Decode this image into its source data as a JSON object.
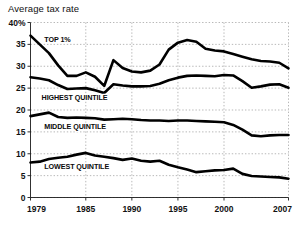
{
  "chart_data": {
    "type": "line",
    "title": "Average tax rate",
    "xlabel": "",
    "ylabel": "",
    "xlim": [
      1979,
      2007
    ],
    "ylim": [
      0,
      40
    ],
    "grid": true,
    "legend_position": "inline-on-lines",
    "x": [
      1979,
      1980,
      1981,
      1982,
      1983,
      1984,
      1985,
      1986,
      1987,
      1988,
      1989,
      1990,
      1991,
      1992,
      1993,
      1994,
      1995,
      1996,
      1997,
      1998,
      1999,
      2000,
      2001,
      2002,
      2003,
      2004,
      2005,
      2006,
      2007
    ],
    "y_ticks": [
      0,
      5,
      10,
      15,
      20,
      25,
      30,
      35,
      40
    ],
    "y_tick_labels": [
      "0",
      "5",
      "10",
      "15",
      "20",
      "25",
      "30",
      "35",
      "40%"
    ],
    "x_ticks": [
      1979,
      1985,
      1990,
      1995,
      2000,
      2007
    ],
    "x_tick_labels": [
      "1979",
      "1985",
      "1990",
      "1995",
      "2000",
      "2007"
    ],
    "series": [
      {
        "name": "TOP 1%",
        "label": "TOP 1%",
        "color": "#000000",
        "values": [
          37.0,
          35.0,
          33.0,
          30.2,
          27.8,
          27.8,
          28.6,
          27.6,
          25.5,
          31.4,
          29.6,
          28.8,
          28.6,
          29.0,
          30.4,
          33.8,
          35.4,
          36.0,
          35.6,
          34.0,
          33.6,
          33.4,
          32.8,
          32.2,
          31.6,
          31.2,
          31.1,
          30.8,
          29.5
        ]
      },
      {
        "name": "HIGHEST QUINTILE",
        "label": "HIGHEST QUINTILE",
        "color": "#000000",
        "values": [
          27.5,
          27.2,
          26.8,
          25.7,
          24.8,
          24.9,
          25.0,
          24.5,
          23.9,
          25.9,
          25.6,
          25.4,
          25.4,
          25.5,
          26.0,
          26.8,
          27.4,
          27.8,
          27.9,
          27.8,
          27.7,
          28.0,
          27.9,
          26.6,
          25.1,
          25.4,
          25.8,
          25.9,
          25.1
        ]
      },
      {
        "name": "MIDDLE QUINTILE",
        "label": "MIDDLE QUINTILE",
        "color": "#000000",
        "values": [
          18.6,
          19.0,
          19.4,
          18.4,
          18.2,
          18.3,
          18.2,
          18.1,
          17.8,
          17.9,
          18.0,
          17.9,
          17.7,
          17.6,
          17.6,
          17.5,
          17.6,
          17.6,
          17.5,
          17.4,
          17.3,
          17.2,
          16.6,
          15.5,
          14.2,
          14.0,
          14.2,
          14.3,
          14.3
        ]
      },
      {
        "name": "LOWEST QUINTILE",
        "label": "LOWEST QUINTILE",
        "color": "#000000",
        "values": [
          8.0,
          8.2,
          8.8,
          9.1,
          9.3,
          9.8,
          10.2,
          9.6,
          9.3,
          9.0,
          8.6,
          8.9,
          8.4,
          8.2,
          8.4,
          7.5,
          6.9,
          6.4,
          5.8,
          6.0,
          6.2,
          6.3,
          6.6,
          5.4,
          4.9,
          4.8,
          4.7,
          4.6,
          4.3
        ]
      }
    ],
    "annotations": [
      {
        "text": "TOP 1%",
        "x": 1980.5,
        "y": 35.5
      },
      {
        "text": "HIGHEST QUINTILE",
        "x": 1980.2,
        "y": 22.4
      },
      {
        "text": "MIDDLE QUINTILE",
        "x": 1980.5,
        "y": 15.6
      },
      {
        "text": "LOWEST QUINTILE",
        "x": 1980.5,
        "y": 6.5
      }
    ]
  }
}
